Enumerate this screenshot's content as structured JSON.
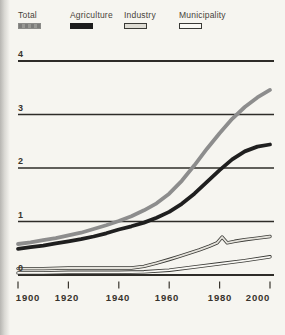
{
  "figure": {
    "background": "#f6f5f0",
    "grid_color": "#2e2c28",
    "tick_color": "#3a362f"
  },
  "legend": {
    "items": [
      {
        "label": "Total",
        "color": "#8d8d8d",
        "texture": "striped"
      },
      {
        "label": "Agriculture",
        "color": "#1c1c1c"
      },
      {
        "label": "Industry",
        "fill": "#dedcd4",
        "border": "#3a3a36"
      },
      {
        "label": "Municipality",
        "fill": "#f9f8f4",
        "border": "#3a3a36"
      }
    ]
  },
  "chart_data": {
    "type": "line",
    "title": "",
    "xlabel": "",
    "ylabel": "",
    "xlim": [
      1900,
      2000
    ],
    "ylim": [
      0,
      4
    ],
    "grid": "horizontal",
    "legend_position": "top",
    "x_ticks": [
      "1900",
      "1920",
      "1940",
      "1960",
      "1980",
      "2000"
    ],
    "x_tick_years": [
      1900,
      1920,
      1940,
      1960,
      1980,
      2000
    ],
    "y_ticks": [
      "4",
      "3",
      "2",
      "1",
      "0"
    ],
    "y_tick_values": [
      4,
      3,
      2,
      1,
      0
    ],
    "series": [
      {
        "name": "Total",
        "render": "line",
        "color": "#8d8d8d",
        "x": [
          1900,
          1905,
          1910,
          1915,
          1920,
          1925,
          1930,
          1935,
          1940,
          1945,
          1950,
          1955,
          1960,
          1965,
          1970,
          1975,
          1980,
          1985,
          1990,
          1995,
          2000
        ],
        "y": [
          0.58,
          0.61,
          0.65,
          0.69,
          0.74,
          0.79,
          0.86,
          0.93,
          1.01,
          1.1,
          1.21,
          1.34,
          1.52,
          1.76,
          2.05,
          2.36,
          2.65,
          2.92,
          3.14,
          3.32,
          3.46
        ]
      },
      {
        "name": "Agriculture",
        "render": "line",
        "color": "#1f1f1f",
        "x": [
          1900,
          1905,
          1910,
          1915,
          1920,
          1925,
          1930,
          1935,
          1940,
          1945,
          1950,
          1955,
          1960,
          1965,
          1970,
          1975,
          1980,
          1985,
          1990,
          1995,
          2000
        ],
        "y": [
          0.49,
          0.52,
          0.55,
          0.59,
          0.63,
          0.67,
          0.72,
          0.78,
          0.85,
          0.91,
          0.98,
          1.07,
          1.18,
          1.33,
          1.52,
          1.74,
          1.96,
          2.16,
          2.31,
          2.4,
          2.44
        ]
      },
      {
        "name": "Industry",
        "render": "band",
        "fill": "#e4e2db",
        "border": "#3a3a36",
        "x": [
          1900,
          1910,
          1920,
          1930,
          1940,
          1945,
          1950,
          1955,
          1960,
          1964,
          1968,
          1972,
          1976,
          1979,
          1981,
          1983,
          1986,
          1990,
          1995,
          2000
        ],
        "y": [
          0.12,
          0.12,
          0.13,
          0.13,
          0.13,
          0.13,
          0.16,
          0.22,
          0.29,
          0.35,
          0.41,
          0.47,
          0.54,
          0.6,
          0.71,
          0.6,
          0.63,
          0.66,
          0.69,
          0.72
        ]
      },
      {
        "name": "Municipality",
        "render": "band",
        "fill": "#f9f8f4",
        "border": "#3a3a36",
        "x": [
          1900,
          1910,
          1920,
          1930,
          1940,
          1950,
          1960,
          1970,
          1980,
          1990,
          2000
        ],
        "y": [
          0.04,
          0.04,
          0.05,
          0.05,
          0.05,
          0.06,
          0.09,
          0.15,
          0.21,
          0.27,
          0.34
        ]
      }
    ]
  }
}
